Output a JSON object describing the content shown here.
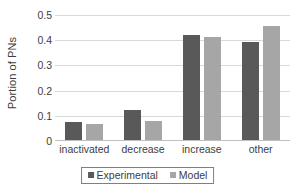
{
  "chart_data": {
    "type": "bar",
    "title": "",
    "xlabel": "",
    "ylabel": "Portion of PNs",
    "categories": [
      "inactivated",
      "decrease",
      "increase",
      "other"
    ],
    "series": [
      {
        "name": "Experimental",
        "color": "#595959",
        "values": [
          0.072,
          0.118,
          0.418,
          0.39
        ]
      },
      {
        "name": "Model",
        "color": "#a6a6a6",
        "values": [
          0.062,
          0.075,
          0.408,
          0.452
        ]
      }
    ],
    "ylim": [
      0,
      0.5
    ],
    "ytick_labels": [
      "0",
      "0.1",
      "0.2",
      "0.3",
      "0.4",
      "0.5"
    ],
    "ytick_values": [
      0,
      0.1,
      0.2,
      0.3,
      0.4,
      0.5
    ],
    "grid": "horizontal",
    "legend_position": "bottom",
    "gridline_color": "#d9d9d9",
    "axis_color": "#bfbfbf",
    "text_color": "#3d3d3d"
  }
}
